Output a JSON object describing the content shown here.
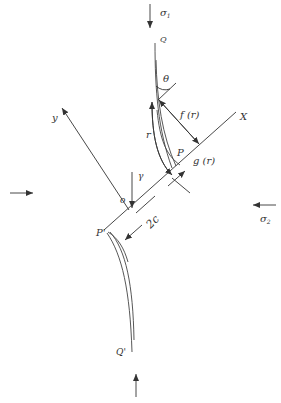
{
  "figure": {
    "type": "crack mechanics schematic",
    "labels": {
      "sigma1": "σ",
      "sigma1_sub": "1",
      "sigma2": "σ",
      "sigma2_sub": "2",
      "Q": "Q",
      "Q_prime": "Q'",
      "theta": "θ",
      "f_r": "f (r)",
      "g_r": "g (r)",
      "r": "r",
      "gamma": "γ",
      "P": "P",
      "P_prime": "P'",
      "origin": "o",
      "X_axis": "X",
      "y_axis": "y",
      "two_c": "2c"
    },
    "colors": {
      "line": "#333333",
      "background": "#ffffff"
    }
  }
}
